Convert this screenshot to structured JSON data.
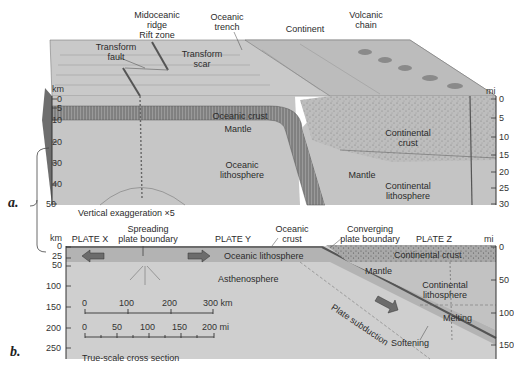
{
  "panel_a": {
    "letter": "a.",
    "surface_labels": {
      "midoceanic_ridge": "Midoceanic ridge",
      "ridge_line1": "Midoceanic",
      "ridge_line2": "ridge",
      "rift_zone": "Rift zone",
      "transform_fault_1": "Transform",
      "transform_fault_2": "fault",
      "transform_scar_1": "Transform",
      "transform_scar_2": "scar",
      "oceanic_trench_1": "Oceanic",
      "oceanic_trench_2": "trench",
      "continent": "Continent",
      "volcanic_chain_1": "Volcanic",
      "volcanic_chain_2": "chain"
    },
    "section_labels": {
      "oceanic_crust": "Oceanic crust",
      "mantle_left": "Mantle",
      "oceanic_lithosphere_1": "Oceanic",
      "oceanic_lithosphere_2": "lithosphere",
      "continental_crust_1": "Continental",
      "continental_crust_2": "crust",
      "mantle_right": "Mantle",
      "continental_lithosphere_1": "Continental",
      "continental_lithosphere_2": "lithosphere"
    },
    "left_axis": {
      "unit": "km",
      "ticks": [
        "0",
        "5",
        "10",
        "20",
        "30",
        "40",
        "50"
      ]
    },
    "right_axis": {
      "unit": "mi",
      "ticks": [
        "0",
        "5",
        "10",
        "15",
        "20",
        "25",
        "30"
      ]
    },
    "caption": "Vertical exaggeration ×5"
  },
  "panel_b": {
    "letter": "b.",
    "top_labels": {
      "plate_x": "PLATE X",
      "spreading_1": "Spreading",
      "spreading_2": "plate boundary",
      "plate_y": "PLATE Y",
      "oceanic_crust_1": "Oceanic",
      "oceanic_crust_2": "crust",
      "converging_1": "Converging",
      "converging_2": "plate boundary",
      "plate_z": "PLATE Z"
    },
    "section_labels": {
      "oceanic_lithosphere": "Oceanic lithosphere",
      "asthenosphere": "Asthenosphere",
      "continental_crust": "Continental crust",
      "mantle": "Mantle",
      "continental_lithosphere_1": "Continental",
      "continental_lithosphere_2": "lithosphere",
      "plate_subduction": "Plate subduction",
      "melting": "Melting",
      "softening": "Softening"
    },
    "left_axis": {
      "unit": "km",
      "ticks": [
        "0",
        "25",
        "50",
        "100",
        "150",
        "200",
        "250"
      ]
    },
    "right_axis": {
      "unit": "mi",
      "ticks": [
        "0",
        "50",
        "100",
        "150"
      ]
    },
    "scale_km": {
      "ticks": [
        "0",
        "100",
        "200",
        "300 km"
      ]
    },
    "scale_mi": {
      "ticks": [
        "0",
        "50",
        "100",
        "150",
        "200 mi"
      ]
    },
    "caption": "True-scale cross section"
  }
}
